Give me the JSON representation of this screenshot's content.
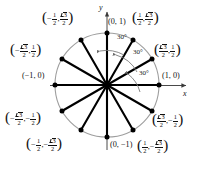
{
  "figure": {
    "type": "unit-circle-diagram",
    "axes": {
      "x_label": "x",
      "y_label": "y"
    },
    "circle": {
      "center": [
        107,
        85
      ],
      "radius": 52,
      "stroke": "#9a9a9a"
    },
    "spoke_color": "#000000",
    "point_color": "#000000",
    "angle_marks": [
      {
        "label": "30°",
        "at_angle_deg": 75
      },
      {
        "label": "30°",
        "at_angle_deg": 45
      },
      {
        "label": "30°",
        "at_angle_deg": 15
      }
    ],
    "points": [
      {
        "angle_deg": 0,
        "x": "1",
        "y": "0",
        "text": "(1, 0)"
      },
      {
        "angle_deg": 30,
        "x": "√3/2",
        "y": "1/2",
        "text": "(√3/2, 1/2)"
      },
      {
        "angle_deg": 60,
        "x": "1/2",
        "y": "√3/2",
        "text": "(1/2, √3/2)"
      },
      {
        "angle_deg": 90,
        "x": "0",
        "y": "1",
        "text": "(0, 1)"
      },
      {
        "angle_deg": 120,
        "x": "-1/2",
        "y": "√3/2",
        "text": "(-1/2, √3/2)"
      },
      {
        "angle_deg": 150,
        "x": "-√3/2",
        "y": "1/2",
        "text": "(-√3/2, 1/2)"
      },
      {
        "angle_deg": 180,
        "x": "-1",
        "y": "0",
        "text": "(-1, 0)"
      },
      {
        "angle_deg": 210,
        "x": "-√3/2",
        "y": "-1/2",
        "text": "(-√3/2, -1/2)"
      },
      {
        "angle_deg": 240,
        "x": "-1/2",
        "y": "-√3/2",
        "text": "(-1/2, -√3/2)"
      },
      {
        "angle_deg": 270,
        "x": "0",
        "y": "-1",
        "text": "(0, -1)"
      },
      {
        "angle_deg": 300,
        "x": "1/2",
        "y": "-√3/2",
        "text": "(1/2, -√3/2)"
      },
      {
        "angle_deg": 330,
        "x": "√3/2",
        "y": "-1/2",
        "text": "(√3/2, -1/2)"
      }
    ]
  },
  "labels": {
    "p0_text": "(1, 0)",
    "p90_text": "(0, 1)",
    "p180_text": "(−1, 0)",
    "p270_text": "(0, −1)",
    "angle1": "30°",
    "angle2": "30°",
    "angle3": "30°",
    "axis_x": "x",
    "axis_y": "y",
    "open_paren": "(",
    "close_paren": ")",
    "comma": ",",
    "minus": "−",
    "one": "1",
    "two": "2",
    "three": "3"
  }
}
